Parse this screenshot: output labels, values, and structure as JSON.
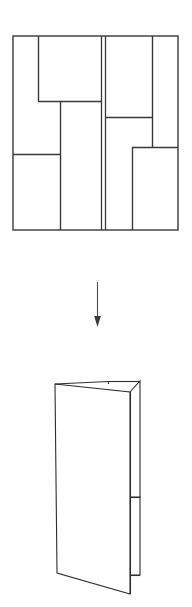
{
  "figure": {
    "title": "Folding pattern to folded form",
    "background_color": "#ffffff",
    "line_color": "#3a3a3a",
    "width": 192,
    "height": 607
  },
  "top_diagram": {
    "name": "unfolded-crease-pattern",
    "label": "Unfolded crease pattern rectangle",
    "bounds": {
      "x": 13,
      "y": 36,
      "width": 165,
      "height": 194
    },
    "outline": {
      "left": 13,
      "top": 36,
      "right": 178,
      "bottom": 230
    },
    "segments": [
      {
        "id": "outer-top",
        "orientation": "horizontal",
        "x1": 13,
        "y1": 36,
        "x2": 178,
        "y2": 36
      },
      {
        "id": "outer-bottom",
        "orientation": "horizontal",
        "x1": 13,
        "y1": 230,
        "x2": 178,
        "y2": 230
      },
      {
        "id": "outer-left",
        "orientation": "vertical",
        "x1": 13,
        "y1": 36,
        "x2": 13,
        "y2": 230
      },
      {
        "id": "outer-right",
        "orientation": "vertical",
        "x1": 178,
        "y1": 36,
        "x2": 178,
        "y2": 230
      },
      {
        "id": "left-inner-vertical",
        "orientation": "vertical",
        "x1": 38,
        "y1": 36,
        "x2": 38,
        "y2": 101
      },
      {
        "id": "left-upper-horizontal",
        "orientation": "horizontal",
        "x1": 38,
        "y1": 101,
        "x2": 101,
        "y2": 101
      },
      {
        "id": "left-mid-vertical",
        "orientation": "vertical",
        "x1": 60,
        "y1": 101,
        "x2": 60,
        "y2": 230
      },
      {
        "id": "left-lower-horizontal",
        "orientation": "horizontal",
        "x1": 13,
        "y1": 154,
        "x2": 60,
        "y2": 154
      },
      {
        "id": "spine-left",
        "orientation": "vertical",
        "x1": 101,
        "y1": 36,
        "x2": 101,
        "y2": 230
      },
      {
        "id": "spine-right",
        "orientation": "vertical",
        "x1": 105,
        "y1": 36,
        "x2": 105,
        "y2": 230
      },
      {
        "id": "right-upper-vertical",
        "orientation": "vertical",
        "x1": 152,
        "y1": 36,
        "x2": 152,
        "y2": 147
      },
      {
        "id": "right-upper-horizontal",
        "orientation": "horizontal",
        "x1": 105,
        "y1": 117,
        "x2": 152,
        "y2": 117
      },
      {
        "id": "right-lower-horizontal",
        "orientation": "horizontal",
        "x1": 132,
        "y1": 147,
        "x2": 178,
        "y2": 147
      },
      {
        "id": "right-lower-vertical",
        "orientation": "vertical",
        "x1": 132,
        "y1": 147,
        "x2": 132,
        "y2": 230
      }
    ]
  },
  "arrow": {
    "name": "transform-arrow",
    "direction": "down",
    "x": 97,
    "y_start": 282,
    "y_end": 327,
    "head_width": 7,
    "head_length": 11,
    "color": "#3a3a3a"
  },
  "bottom_diagram": {
    "name": "folded-form",
    "label": "Folded booklet form in perspective",
    "bounds": {
      "x": 55,
      "y": 378,
      "width": 86,
      "height": 218
    },
    "panels": [
      {
        "id": "left-panel",
        "points": "55,384 130,392 130,594 57,573"
      },
      {
        "id": "right-panel-upper",
        "points": "130,392 140,381 140,497 130,497"
      },
      {
        "id": "right-panel-lower",
        "points": "130,497 140,497 140,575 130,575"
      }
    ],
    "fold_lines": [
      {
        "id": "center-fold",
        "x1": 130,
        "y1": 392,
        "x2": 130,
        "y2": 594
      },
      {
        "id": "top-notch",
        "x1": 108,
        "y1": 382,
        "x2": 108,
        "y2": 383
      },
      {
        "id": "top-edge-right",
        "x1": 108,
        "y1": 381,
        "x2": 140,
        "y2": 381
      },
      {
        "id": "right-panel-divider",
        "x1": 130,
        "y1": 497,
        "x2": 140,
        "y2": 497
      },
      {
        "id": "right-panel-bottom",
        "x1": 130,
        "y1": 575,
        "x2": 140,
        "y2": 575
      }
    ]
  }
}
